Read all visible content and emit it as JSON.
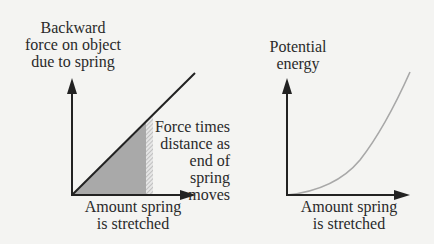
{
  "left_panel": {
    "y_label": [
      "Backward",
      "force on object",
      "due to spring"
    ],
    "x_label": [
      "Amount spring",
      "is stretched"
    ],
    "annotation": [
      "Force times",
      "distance as",
      "end of spring",
      "moves"
    ],
    "curve": "linear",
    "shaded_region": "area under force line (gray)",
    "hatched_strip": "small increment of stretch"
  },
  "right_panel": {
    "y_label": [
      "Potential",
      "energy"
    ],
    "x_label": [
      "Amount spring",
      "is stretched"
    ],
    "curve": "quadratic"
  },
  "colors": {
    "axis": "#222222",
    "force_line": "#222222",
    "shade": "#a9a9a9",
    "energy_curve": "#a8a8a8",
    "background": "#f4f4f2"
  }
}
